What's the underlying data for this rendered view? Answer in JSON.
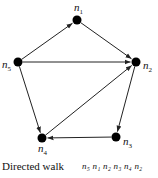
{
  "diagram": {
    "type": "directed-graph",
    "nodes": [
      {
        "id": "n1",
        "label": "n",
        "sub": "1",
        "x": 77,
        "y": 20
      },
      {
        "id": "n2",
        "label": "n",
        "sub": "2",
        "x": 136,
        "y": 62
      },
      {
        "id": "n3",
        "label": "n",
        "sub": "3",
        "x": 116,
        "y": 137
      },
      {
        "id": "n4",
        "label": "n",
        "sub": "4",
        "x": 42,
        "y": 138
      },
      {
        "id": "n5",
        "label": "n",
        "sub": "5",
        "x": 18,
        "y": 62
      }
    ],
    "edges": [
      {
        "from": "n5",
        "to": "n1"
      },
      {
        "from": "n1",
        "to": "n2"
      },
      {
        "from": "n5",
        "to": "n2"
      },
      {
        "from": "n5",
        "to": "n4"
      },
      {
        "from": "n2",
        "to": "n3"
      },
      {
        "from": "n3",
        "to": "n4"
      },
      {
        "from": "n4",
        "to": "n2"
      }
    ],
    "caption": "Directed walk",
    "walk": "n5 n1 n2 n3 n4 n2",
    "walk_text": "n₅ n₁ n₂ n₃ n₄ n₂",
    "colors": {
      "node": "#000000",
      "edge": "#222222"
    }
  }
}
